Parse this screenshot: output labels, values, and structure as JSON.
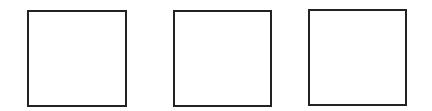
{
  "diagram": {
    "background": "#ffffff",
    "stroke_color": "#222222",
    "shapes": [
      {
        "type": "square",
        "label": "",
        "x": 27,
        "y": 10,
        "width": 100,
        "height": 97
      },
      {
        "type": "square",
        "label": "",
        "x": 173,
        "y": 10,
        "width": 99,
        "height": 97
      },
      {
        "type": "square",
        "label": "",
        "x": 308,
        "y": 9,
        "width": 99,
        "height": 97
      }
    ]
  }
}
